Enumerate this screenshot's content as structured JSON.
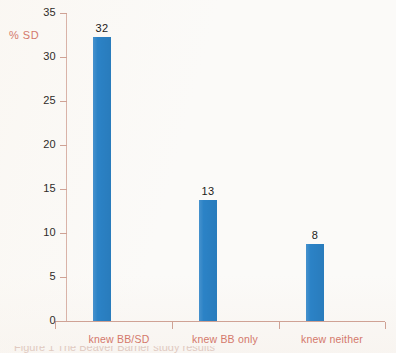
{
  "chart_data": {
    "type": "bar",
    "title": "",
    "subtitle": "",
    "xlabel": "",
    "ylabel": "% SD",
    "categories": [
      "knew BB/SD",
      "knew BB only",
      "knew neither"
    ],
    "values": [
      32,
      13,
      8
    ],
    "bar_heights": [
      32.3,
      13.8,
      8.7
    ],
    "data_labels": [
      "32",
      "13",
      "8"
    ],
    "ylim": [
      0,
      35
    ],
    "yticks": [
      0,
      5,
      10,
      15,
      20,
      25,
      30,
      35
    ],
    "ytick_labels": [
      "0",
      "5",
      "10",
      "15",
      "20",
      "25",
      "30",
      "35"
    ],
    "grid": false,
    "legend": null,
    "series": [
      {
        "name": "% SD",
        "values": [
          32,
          13,
          8
        ]
      }
    ],
    "colors": {
      "bar": "#2b82c6",
      "axis_line": "#cfa295",
      "axis_title": "#d4786b",
      "category_label": "#d4786b",
      "tick_label": "#2f2b29",
      "data_label": "#1c1a19",
      "background": "#fbfaf8"
    }
  },
  "caption": {
    "partial_text": "Figure 1  The Beaver Barrier study results"
  }
}
